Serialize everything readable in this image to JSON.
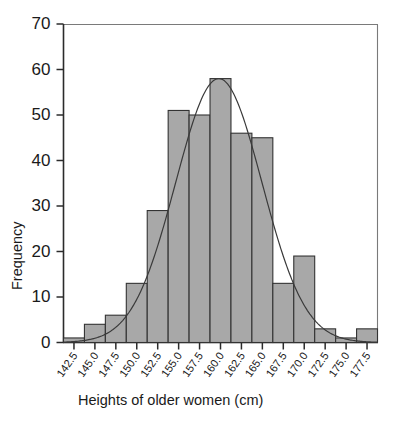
{
  "chart_data": {
    "type": "bar",
    "title": "",
    "subtitle": "",
    "xlabel": "Heights of older women (cm)",
    "ylabel": "Frequency",
    "categories": [
      "142.5",
      "145.0",
      "147.5",
      "150.0",
      "152.5",
      "155.0",
      "157.5",
      "160.0",
      "162.5",
      "165.0",
      "167.5",
      "170.0",
      "172.5",
      "175.0",
      "177.5"
    ],
    "bin_edges": [
      141.25,
      143.75,
      146.25,
      148.75,
      151.25,
      153.75,
      156.25,
      158.75,
      161.25,
      163.75,
      166.25,
      168.75,
      171.25,
      173.75,
      176.25,
      178.75
    ],
    "values": [
      1,
      4,
      6,
      13,
      29,
      51,
      50,
      58,
      46,
      45,
      13,
      19,
      3,
      1,
      3
    ],
    "xlim": [
      141.25,
      178.75
    ],
    "ylim": [
      0,
      70
    ],
    "ytick_labels": [
      "0",
      "10",
      "20",
      "30",
      "40",
      "50",
      "60",
      "70"
    ],
    "ytick_values": [
      0,
      10,
      20,
      30,
      40,
      50,
      60,
      70
    ],
    "xtick_labels": [
      "142.5",
      "145.0",
      "147.5",
      "150.0",
      "152.5",
      "155.0",
      "157.5",
      "160.0",
      "162.5",
      "165.0",
      "167.5",
      "170.0",
      "172.5",
      "175.0",
      "177.5"
    ],
    "grid": false,
    "legend": "none",
    "overlay": {
      "name": "normal-curve",
      "type": "line",
      "mean": 159.8,
      "std": 5.15,
      "peak": 58,
      "color": "#3a3a3a"
    },
    "bar_color": "#a8a8a8",
    "bar_edge_color": "#333333",
    "axis_color": "#2b2b2b"
  },
  "axes": {
    "y_label": "Frequency",
    "x_label": "Heights of older women (cm)"
  }
}
